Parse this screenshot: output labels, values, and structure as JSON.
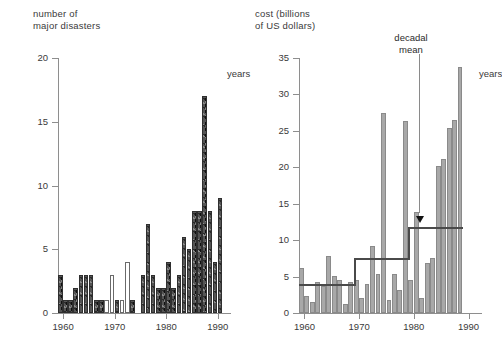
{
  "left": {
    "axis_title": "number of\nmajor disasters",
    "y_ticks": [
      0,
      5,
      10,
      15,
      20
    ],
    "x_ticks": [
      1960,
      1970,
      1980,
      1990
    ],
    "x_unit": "years"
  },
  "right": {
    "axis_title": "cost (billions\nof US dollars)",
    "y_ticks": [
      0,
      5,
      10,
      15,
      20,
      25,
      30,
      35
    ],
    "x_ticks": [
      1960,
      1970,
      1980,
      1990
    ],
    "x_unit": "years",
    "annotation": "decadal\nmean"
  },
  "colors": {
    "bar_dark": "#555555",
    "bar_gray": "#a8a8a8",
    "bar_open": "#ffffff",
    "axis": "#8e8e8e",
    "mean_line": "#4a4a4a",
    "text": "#2b2b2b"
  },
  "chart_data": [
    {
      "type": "bar",
      "title": "number of major disasters",
      "xlabel": "years",
      "ylabel": "number of major disasters",
      "xlim": [
        1959,
        1991
      ],
      "ylim": [
        0,
        20
      ],
      "yticks": [
        0,
        5,
        10,
        15,
        20
      ],
      "xticks": [
        1960,
        1970,
        1980,
        1990
      ],
      "grid": false,
      "legend": "none",
      "x": [
        1959,
        1960,
        1961,
        1962,
        1963,
        1964,
        1965,
        1966,
        1967,
        1968,
        1969,
        1970,
        1971,
        1972,
        1973,
        1974,
        1975,
        1976,
        1977,
        1978,
        1979,
        1980,
        1981,
        1982,
        1983,
        1984,
        1985,
        1986,
        1987,
        1988,
        1989,
        1990
      ],
      "values": [
        3,
        1,
        1,
        2,
        3,
        3,
        3,
        1,
        1,
        1,
        3,
        1,
        1,
        4,
        1,
        0,
        3,
        7,
        3,
        2,
        2,
        4,
        2,
        3,
        6,
        5,
        8,
        8,
        17,
        8,
        4,
        9
      ],
      "bar_style": [
        "dark",
        "dark",
        "dark",
        "dark",
        "dark",
        "dark",
        "dark",
        "dark",
        "dark",
        "open",
        "open",
        "dark",
        "open",
        "open",
        "dark",
        "none",
        "dark",
        "dark",
        "dark",
        "dark",
        "dark",
        "dark",
        "dark",
        "dark",
        "dark",
        "dark",
        "dark",
        "dark",
        "dark",
        "dark",
        "dark",
        "dark"
      ],
      "note": "open (unfilled outline) bars appear around 1968-1972; a gap with no bar near 1974-1975"
    },
    {
      "type": "bar",
      "title": "cost (billions of US dollars)",
      "xlabel": "years",
      "ylabel": "cost (billions of US dollars)",
      "xlim": [
        1959,
        1991
      ],
      "ylim": [
        0,
        35
      ],
      "yticks": [
        0,
        5,
        10,
        15,
        20,
        25,
        30,
        35
      ],
      "xticks": [
        1960,
        1970,
        1980,
        1990
      ],
      "grid": false,
      "legend": "none",
      "x": [
        1959,
        1960,
        1961,
        1962,
        1963,
        1964,
        1965,
        1966,
        1967,
        1968,
        1969,
        1970,
        1971,
        1972,
        1973,
        1974,
        1975,
        1976,
        1977,
        1978,
        1979,
        1980,
        1981,
        1982,
        1983,
        1984,
        1985,
        1986,
        1987,
        1988
      ],
      "values": [
        6.2,
        2.3,
        1.5,
        4.2,
        3.7,
        7.8,
        5.1,
        4.6,
        1.2,
        4.3,
        4.5,
        2.1,
        4.0,
        9.2,
        5.4,
        27.4,
        1.8,
        5.4,
        3.1,
        26.3,
        4.6,
        13.8,
        2.0,
        6.8,
        7.5,
        20.2,
        21.2,
        25.4,
        26.5,
        33.7
      ],
      "overlay": {
        "name": "decadal mean",
        "type": "step",
        "segments": [
          {
            "x_start": 1959,
            "x_end": 1969,
            "value": 4.0
          },
          {
            "x_start": 1969,
            "x_end": 1979,
            "value": 7.5
          },
          {
            "x_start": 1979,
            "x_end": 1989,
            "value": 11.8
          }
        ]
      },
      "annotation": {
        "text": "decadal mean",
        "points_to_value": 11.8,
        "at_year": 1981
      }
    }
  ]
}
